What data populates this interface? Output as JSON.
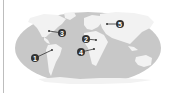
{
  "map": {
    "projection": "elliptical world map",
    "ocean_color": "#c8c8c8",
    "land_color": "#f2f2f2",
    "marker_color": "#333333",
    "markers": [
      {
        "label": "1",
        "x": 35,
        "y": 58,
        "target_x": 52,
        "target_y": 50
      },
      {
        "label": "2",
        "x": 86,
        "y": 39,
        "target_x": 96,
        "target_y": 40
      },
      {
        "label": "3",
        "x": 62,
        "y": 33,
        "target_x": 49,
        "target_y": 31
      },
      {
        "label": "4",
        "x": 81,
        "y": 52,
        "target_x": 94,
        "target_y": 49
      },
      {
        "label": "5",
        "x": 120,
        "y": 24,
        "target_x": 107,
        "target_y": 24
      }
    ]
  }
}
